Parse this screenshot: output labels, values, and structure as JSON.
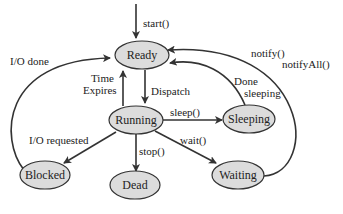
{
  "diagram": {
    "nodes": [
      {
        "id": "ready",
        "label": "Ready"
      },
      {
        "id": "running",
        "label": "Running"
      },
      {
        "id": "sleeping",
        "label": "Sleeping"
      },
      {
        "id": "blocked",
        "label": "Blocked"
      },
      {
        "id": "dead",
        "label": "Dead"
      },
      {
        "id": "waiting",
        "label": "Waiting"
      }
    ],
    "edges": [
      {
        "from": "start",
        "to": "ready",
        "label": "start()"
      },
      {
        "from": "blocked",
        "to": "ready",
        "label": "I/O done"
      },
      {
        "from": "running",
        "to": "ready",
        "label_line1": "Time",
        "label_line2": "Expires"
      },
      {
        "from": "ready",
        "to": "running",
        "label": "Dispatch"
      },
      {
        "from": "running",
        "to": "sleeping",
        "label": "sleep()"
      },
      {
        "from": "sleeping",
        "to": "ready",
        "label_line1": "Done",
        "label_line2": "sleeping"
      },
      {
        "from": "waiting",
        "to": "ready",
        "label_line1": "notify()",
        "label_line2": "notifyAll()"
      },
      {
        "from": "running",
        "to": "blocked",
        "label": "I/O requested"
      },
      {
        "from": "running",
        "to": "dead",
        "label": "stop()"
      },
      {
        "from": "running",
        "to": "waiting",
        "label": "wait()"
      }
    ]
  }
}
